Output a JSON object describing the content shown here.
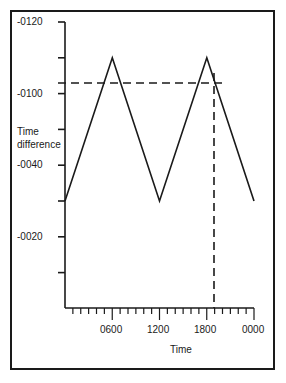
{
  "chart_data": {
    "type": "line",
    "title": "",
    "xlabel": "Time",
    "ylabel": "Time difference",
    "x_tick_labels": [
      "0600",
      "1200",
      "1800",
      "0000"
    ],
    "x_ticks_hours": [
      6,
      12,
      18,
      24
    ],
    "x_minor_tick_interval_hours": 1,
    "xlim": [
      0,
      24
    ],
    "y_tick_labels": [
      {
        "label": "-0120",
        "tick_index": 0
      },
      {
        "label": "-0100",
        "tick_index": 2
      },
      {
        "label": "-0040",
        "tick_index": 4
      },
      {
        "label": "-0020",
        "tick_index": 6
      }
    ],
    "y_tick_count": 8,
    "series": [
      {
        "name": "time difference",
        "style": "solid",
        "x": [
          0,
          6,
          12,
          18,
          24
        ],
        "y_tick_position": [
          5,
          1,
          5,
          1,
          5
        ],
        "description": "triangle wave: peaks at 0600 and 1800, troughs at 0000, 1200 and 0000"
      }
    ],
    "annotations": [
      {
        "type": "horizontal-dashed-line",
        "y_tick_position": 1.7,
        "x_range": [
          0,
          19.5
        ]
      },
      {
        "type": "vertical-dashed-line",
        "x": 18.5,
        "from_y_tick_position": 1.4,
        "to": "x-axis"
      }
    ],
    "grid": false,
    "legend": null
  },
  "labels": {
    "y": [
      "-0120",
      "-0100",
      "-0040",
      "-0020"
    ],
    "ylabel_line1": "Time",
    "ylabel_line2": "difference",
    "x": [
      "0600",
      "1200",
      "1800",
      "0000"
    ],
    "xlabel": "Time"
  }
}
